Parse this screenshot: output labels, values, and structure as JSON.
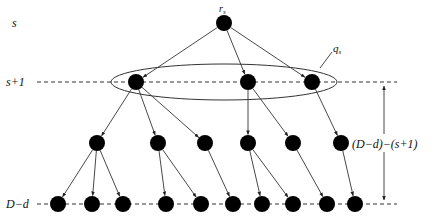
{
  "diagram": {
    "type": "tree-levels",
    "level_labels": {
      "s": "s",
      "s_plus_1": "s+1",
      "D_minus_d": "D−d"
    },
    "node_labels": {
      "root": "r",
      "root_sub": "s",
      "group": "q",
      "group_sub": "s"
    },
    "span_label": "(D−d)−(s+1)",
    "nodes": {
      "root": [
        224,
        23
      ],
      "level1": [
        [
          136,
          82
        ],
        [
          248,
          82
        ],
        [
          312,
          82
        ]
      ],
      "level2": [
        [
          97,
          143
        ],
        [
          158,
          143
        ],
        [
          205,
          143
        ],
        [
          248,
          143
        ],
        [
          293,
          143
        ],
        [
          341,
          143
        ]
      ],
      "level3": [
        [
          58,
          204
        ],
        [
          92,
          204
        ],
        [
          123,
          204
        ],
        [
          166,
          204
        ],
        [
          201,
          204
        ],
        [
          233,
          204
        ],
        [
          262,
          204
        ],
        [
          293,
          204
        ],
        [
          327,
          204
        ],
        [
          355,
          204
        ]
      ]
    },
    "edges": {
      "root_to_level1": [
        0,
        1,
        2
      ],
      "level1_to_level2": [
        [
          0,
          0
        ],
        [
          0,
          1
        ],
        [
          0,
          2
        ],
        [
          1,
          3
        ],
        [
          1,
          4
        ],
        [
          2,
          5
        ]
      ],
      "level2_to_level3": [
        [
          0,
          0
        ],
        [
          0,
          1
        ],
        [
          0,
          2
        ],
        [
          1,
          3
        ],
        [
          1,
          4
        ],
        [
          2,
          5
        ],
        [
          3,
          6
        ],
        [
          3,
          7
        ],
        [
          4,
          8
        ],
        [
          5,
          9
        ]
      ]
    }
  }
}
